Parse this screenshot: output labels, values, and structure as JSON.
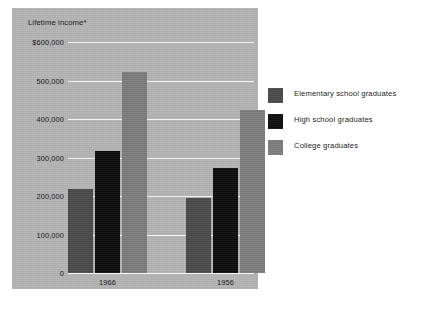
{
  "chart_data": {
    "type": "bar",
    "title": "Lifetime income*",
    "xlabel": "",
    "ylabel": "",
    "categories": [
      "1966",
      "1956"
    ],
    "series": [
      {
        "name": "Elementary school graduates",
        "color": "#4a4a4a",
        "values": [
          218000,
          195000
        ]
      },
      {
        "name": "High school graduates",
        "color": "#0d0d0d",
        "values": [
          316000,
          274000
        ]
      },
      {
        "name": "College graduates",
        "color": "#7d7d7d",
        "values": [
          522000,
          424000
        ]
      }
    ],
    "ylim": [
      0,
      600000
    ],
    "yticks": [
      0,
      100000,
      200000,
      300000,
      400000,
      500000,
      600000
    ],
    "ytick_labels": [
      "0",
      "100,000",
      "200,000",
      "300,000",
      "400,000",
      "500,000",
      "$600,000"
    ],
    "grid": true,
    "legend_position": "right",
    "plot_background": "#b4b4b4",
    "gridline_color": "#f2f2f2"
  },
  "legend": {
    "items": [
      {
        "label": "Elementary school graduates",
        "swatch_name": "legend-swatch-elementary"
      },
      {
        "label": "High school graduates",
        "swatch_name": "legend-swatch-high-school"
      },
      {
        "label": "College graduates",
        "swatch_name": "legend-swatch-college"
      }
    ]
  }
}
